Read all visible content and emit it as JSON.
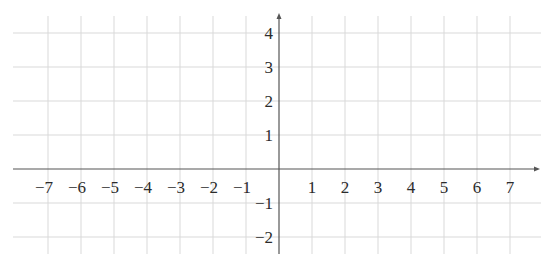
{
  "chart_data": {
    "type": "coordinate-grid",
    "title": "",
    "xlabel": "",
    "ylabel": "",
    "xlim": [
      -8,
      8
    ],
    "ylim": [
      -2.5,
      4.5
    ],
    "grid": true,
    "x_ticks": [
      -7,
      -6,
      -5,
      -4,
      -3,
      -2,
      -1,
      1,
      2,
      3,
      4,
      5,
      6,
      7
    ],
    "x_tick_labels": [
      "−7",
      "−6",
      "−5",
      "−4",
      "−3",
      "−2",
      "−1",
      "1",
      "2",
      "3",
      "4",
      "5",
      "6",
      "7"
    ],
    "y_ticks": [
      4,
      3,
      2,
      1,
      -1,
      -2
    ],
    "y_tick_labels": [
      "4",
      "3",
      "2",
      "1",
      "−1",
      "−2"
    ],
    "axis_arrows": [
      "x-positive",
      "y-positive"
    ],
    "series": []
  },
  "colors": {
    "grid": "#d9d9d9",
    "axis": "#555555",
    "text": "#2b2b2b",
    "background": "#ffffff"
  }
}
